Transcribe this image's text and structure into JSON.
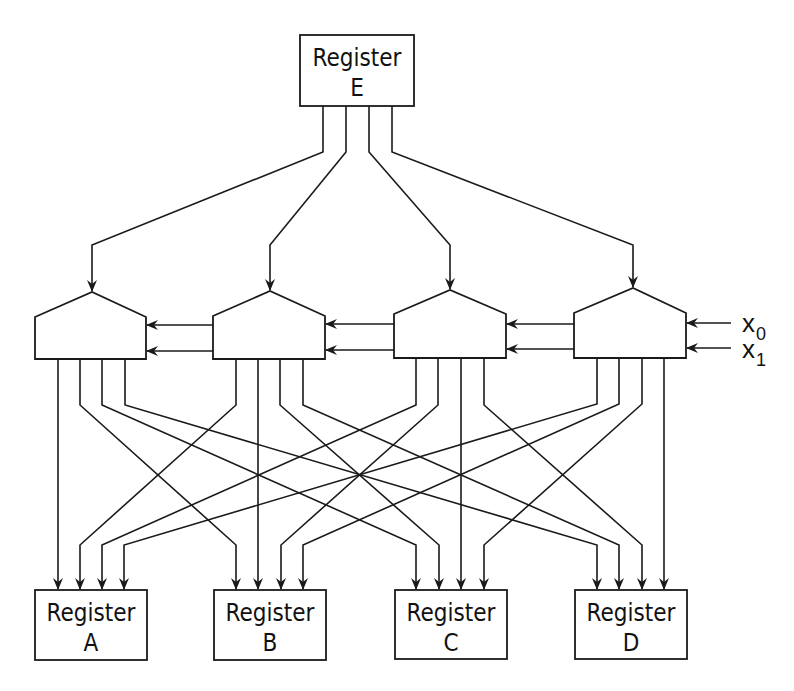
{
  "diagram": {
    "source_register": {
      "title": "Register",
      "letter": "E"
    },
    "destination_registers": [
      {
        "title": "Register",
        "letter": "A"
      },
      {
        "title": "Register",
        "letter": "B"
      },
      {
        "title": "Register",
        "letter": "C"
      },
      {
        "title": "Register",
        "letter": "D"
      }
    ],
    "selector_units_count": 4,
    "inputs": [
      {
        "label": "x",
        "subscript": "0"
      },
      {
        "label": "x",
        "subscript": "1"
      }
    ],
    "colors": {
      "stroke": "#1a1a1a",
      "background": "#ffffff"
    }
  }
}
